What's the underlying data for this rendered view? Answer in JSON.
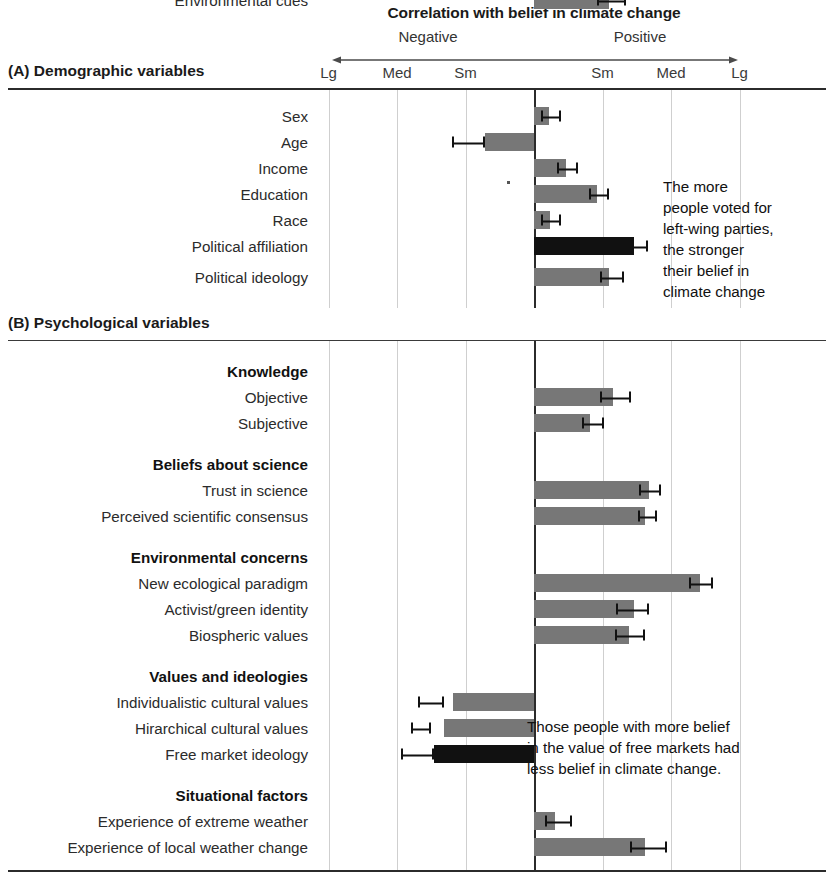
{
  "chart_data": {
    "type": "bar",
    "orientation": "horizontal",
    "title": "Correlation with belief in climate change",
    "xlabel": "",
    "ylabel": "",
    "grid": true,
    "legend": null,
    "direction_labels": {
      "negative": "Negative",
      "positive": "Positive"
    },
    "tick_labels": [
      "Lg",
      "Med",
      "Sm",
      "Sm",
      "Med",
      "Lg"
    ],
    "tick_positions": [
      -3,
      -2,
      -1,
      1,
      2,
      3
    ],
    "xlim": [
      -3.5,
      3.9
    ],
    "axis_note": "Effect-size scale: Sm = small, Med = medium, Lg = large; negative to the left of zero, positive to the right.",
    "panels": [
      {
        "id": "A",
        "label": "(A) Demographic variables",
        "rows": [
          {
            "label": "Sex",
            "type": "bar",
            "value": 0.22,
            "err_low": 0.1,
            "err_high": 0.4,
            "color": "grey",
            "bold": false
          },
          {
            "label": "Age",
            "type": "bar",
            "value": -0.72,
            "err_low": -1.2,
            "err_high": -0.72,
            "color": "grey",
            "bold": false
          },
          {
            "label": "Income",
            "type": "bar",
            "value": 0.46,
            "err_low": 0.34,
            "err_high": 0.64,
            "color": "grey",
            "bold": false
          },
          {
            "label": "Education",
            "type": "bar",
            "value": 0.92,
            "err_low": 0.8,
            "err_high": 1.1,
            "color": "grey",
            "bold": false
          },
          {
            "label": "Race",
            "type": "bar",
            "value": 0.23,
            "err_low": 0.1,
            "err_high": 0.4,
            "color": "grey",
            "bold": false
          },
          {
            "label": "Political affiliation",
            "type": "bar",
            "value": 1.46,
            "err_low": 1.4,
            "err_high": 1.66,
            "color": "black",
            "bold": false
          },
          {
            "label": "Political ideology",
            "type": "bar",
            "value": 1.1,
            "err_low": 0.96,
            "err_high": 1.32,
            "color": "grey",
            "bold": false
          }
        ]
      },
      {
        "id": "B",
        "label": "(B) Psychological variables",
        "rows": [
          {
            "label": "Knowledge",
            "type": "group"
          },
          {
            "label": "Objective",
            "type": "bar",
            "value": 1.16,
            "err_low": 0.96,
            "err_high": 1.42,
            "color": "grey",
            "bold": false
          },
          {
            "label": "Subjective",
            "type": "bar",
            "value": 0.82,
            "err_low": 0.7,
            "err_high": 1.02,
            "color": "grey",
            "bold": false
          },
          {
            "label": "Beliefs about science",
            "type": "group"
          },
          {
            "label": "Trust in science",
            "type": "bar",
            "value": 1.68,
            "err_low": 1.54,
            "err_high": 1.86,
            "color": "grey",
            "bold": false
          },
          {
            "label": "Perceived scientific consensus",
            "type": "bar",
            "value": 1.62,
            "err_low": 1.52,
            "err_high": 1.8,
            "color": "grey",
            "bold": false
          },
          {
            "label": "Environmental concerns",
            "type": "group"
          },
          {
            "label": "New ecological paradigm",
            "type": "bar",
            "value": 2.42,
            "err_low": 2.26,
            "err_high": 2.62,
            "color": "grey",
            "bold": false
          },
          {
            "label": "Activist/green identity",
            "type": "bar",
            "value": 1.46,
            "err_low": 1.2,
            "err_high": 1.68,
            "color": "grey",
            "bold": false
          },
          {
            "label": "Biospheric values",
            "type": "bar",
            "value": 1.38,
            "err_low": 1.18,
            "err_high": 1.62,
            "color": "grey",
            "bold": false
          },
          {
            "label": "Values and ideologies",
            "type": "group"
          },
          {
            "label": "Individualistic cultural values",
            "type": "bar",
            "value": -1.18,
            "err_low": -1.7,
            "err_high": -1.32,
            "color": "grey",
            "bold": false
          },
          {
            "label": "Hirarchical cultural values",
            "type": "bar",
            "value": -1.32,
            "err_low": -1.8,
            "err_high": -1.5,
            "color": "grey",
            "bold": false
          },
          {
            "label": "Free market ideology",
            "type": "bar",
            "value": -1.46,
            "err_low": -1.94,
            "err_high": -1.46,
            "color": "black",
            "bold": false
          },
          {
            "label": "Situational factors",
            "type": "group"
          },
          {
            "label": "Experience of extreme weather",
            "type": "bar",
            "value": 0.3,
            "err_low": 0.16,
            "err_high": 0.56,
            "color": "grey",
            "bold": false
          },
          {
            "label": "Experience of local weather change",
            "type": "bar",
            "value": 1.62,
            "err_low": 1.4,
            "err_high": 1.94,
            "color": "grey",
            "bold": false
          },
          {
            "label": "Environmental cues",
            "type": "bar",
            "value": 1.1,
            "err_low": 0.92,
            "err_high": 1.34,
            "color": "grey",
            "bold": false
          }
        ]
      }
    ],
    "annotations": [
      {
        "id": "annot-a",
        "text": "The more\npeople voted for\nleft-wing parties,\nthe stronger\ntheir belief in\nclimate change"
      },
      {
        "id": "annot-b",
        "text": "Those people with more belief\nin the value of free markets had\nless belief in climate change."
      }
    ],
    "colors": {
      "bar_grey": "#777777",
      "bar_black": "#111111",
      "gridline": "#cfcfcf",
      "zeroline": "#2b2b2b",
      "text": "#1a1a1a",
      "background": "#ffffff"
    }
  }
}
